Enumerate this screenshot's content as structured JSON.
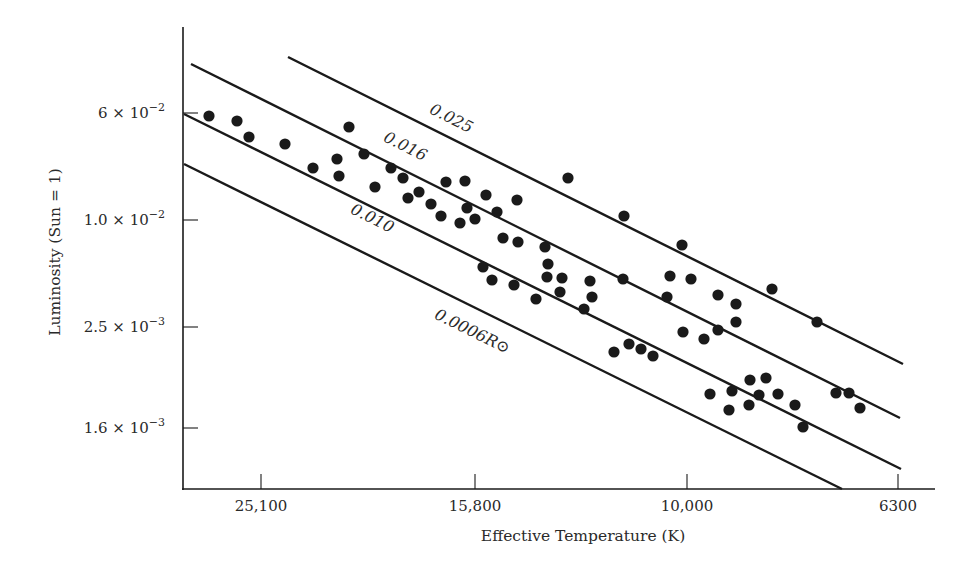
{
  "chart_data": {
    "type": "scatter",
    "title": "",
    "xlabel": "Effective Temperature (K)",
    "ylabel": "Luminosity (Sun = 1)",
    "x_scale": "log, decreasing left to right",
    "y_scale": "log",
    "grid": false,
    "legend": null,
    "x_ticks": [
      {
        "label": "25,100",
        "value": 25100,
        "px": 261
      },
      {
        "label": "15,800",
        "value": 15800,
        "px": 475
      },
      {
        "label": "10,000",
        "value": 10000,
        "px": 687
      },
      {
        "label": "6300",
        "value": 6300,
        "px": 898
      }
    ],
    "y_ticks": [
      {
        "mant": "6 × 10",
        "exp": "−2",
        "value": 0.06,
        "px": 113
      },
      {
        "mant": "1.0 × 10",
        "exp": "−2",
        "value": 0.01,
        "px": 220
      },
      {
        "mant": "2.5 × 10",
        "exp": "−3",
        "value": 0.0025,
        "px": 327
      },
      {
        "mant": "1.6 × 10",
        "exp": "−3",
        "value": 0.0016,
        "px": 428
      }
    ],
    "radius_lines": [
      {
        "label": "0.025",
        "suffix": "",
        "x1": 288,
        "y1": 57,
        "x2": 903,
        "y2": 364,
        "lx": 449,
        "ly": 123
      },
      {
        "label": "0.016",
        "suffix": "",
        "x1": 191,
        "y1": 64,
        "x2": 900,
        "y2": 418,
        "lx": 403,
        "ly": 151
      },
      {
        "label": "0.010",
        "suffix": "",
        "x1": 184,
        "y1": 114,
        "x2": 901,
        "y2": 469,
        "lx": 370,
        "ly": 223
      },
      {
        "label": "0.0006",
        "suffix": "R⊙",
        "x1": 184,
        "y1": 164,
        "x2": 842,
        "y2": 489,
        "lx": 470,
        "ly": 336
      }
    ],
    "series": [
      {
        "name": "white dwarfs",
        "marker": "filled circle",
        "points_px": [
          [
            209,
            116
          ],
          [
            237,
            121
          ],
          [
            249,
            137
          ],
          [
            285,
            144
          ],
          [
            313,
            168
          ],
          [
            337,
            159
          ],
          [
            339,
            176
          ],
          [
            349,
            127
          ],
          [
            364,
            154
          ],
          [
            375,
            187
          ],
          [
            391,
            168
          ],
          [
            403,
            178
          ],
          [
            408,
            198
          ],
          [
            419,
            192
          ],
          [
            431,
            204
          ],
          [
            441,
            216
          ],
          [
            446,
            182
          ],
          [
            465,
            181
          ],
          [
            467,
            208
          ],
          [
            460,
            223
          ],
          [
            475,
            219
          ],
          [
            486,
            195
          ],
          [
            497,
            212
          ],
          [
            517,
            200
          ],
          [
            568,
            178
          ],
          [
            624,
            216
          ],
          [
            503,
            238
          ],
          [
            518,
            242
          ],
          [
            545,
            247
          ],
          [
            548,
            264
          ],
          [
            547,
            277
          ],
          [
            562,
            278
          ],
          [
            560,
            292
          ],
          [
            590,
            281
          ],
          [
            592,
            297
          ],
          [
            584,
            309
          ],
          [
            536,
            299
          ],
          [
            514,
            285
          ],
          [
            492,
            280
          ],
          [
            483,
            267
          ],
          [
            623,
            279
          ],
          [
            670,
            276
          ],
          [
            667,
            297
          ],
          [
            682,
            245
          ],
          [
            691,
            279
          ],
          [
            718,
            295
          ],
          [
            736,
            304
          ],
          [
            736,
            322
          ],
          [
            772,
            289
          ],
          [
            817,
            322
          ],
          [
            683,
            332
          ],
          [
            704,
            339
          ],
          [
            718,
            330
          ],
          [
            614,
            352
          ],
          [
            629,
            344
          ],
          [
            641,
            349
          ],
          [
            653,
            356
          ],
          [
            710,
            394
          ],
          [
            732,
            391
          ],
          [
            729,
            410
          ],
          [
            750,
            380
          ],
          [
            766,
            378
          ],
          [
            759,
            395
          ],
          [
            749,
            405
          ],
          [
            778,
            394
          ],
          [
            795,
            405
          ],
          [
            803,
            427
          ],
          [
            836,
            393
          ],
          [
            849,
            393
          ],
          [
            860,
            408
          ]
        ]
      }
    ],
    "annotations": [
      "Lines of constant radius: 0.025, 0.016, 0.010, 0.0006 R⊙"
    ]
  },
  "style": {
    "ink": "#1a1a1a",
    "background": "#ffffff"
  }
}
